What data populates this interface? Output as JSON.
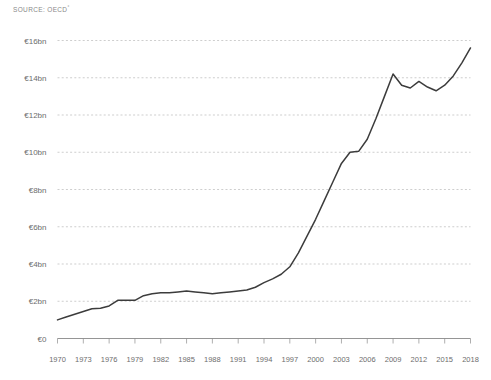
{
  "source": {
    "prefix": "SOURCE: OECD",
    "superscript": "°"
  },
  "chart_data": {
    "type": "line",
    "title": "",
    "subtitle": "",
    "xlabel": "",
    "ylabel": "",
    "grid": "horizontal-dashed",
    "legend": "none",
    "xlim": [
      1970,
      2018
    ],
    "ylim": [
      0,
      16
    ],
    "y_unit": "€bn",
    "y_ticks": [
      0,
      2,
      4,
      6,
      8,
      10,
      12,
      14,
      16
    ],
    "y_tick_labels": [
      "€0",
      "€2bn",
      "€4bn",
      "€6bn",
      "€8bn",
      "€10bn",
      "€12bn",
      "€14bn",
      "€16bn"
    ],
    "x_ticks": [
      1970,
      1973,
      1976,
      1979,
      1982,
      1985,
      1988,
      1991,
      1994,
      1997,
      2000,
      2003,
      2006,
      2009,
      2012,
      2015,
      2018
    ],
    "x_tick_labels": [
      "1970",
      "1973",
      "1976",
      "1979",
      "1982",
      "1985",
      "1988",
      "1991",
      "1994",
      "1997",
      "2000",
      "2003",
      "2006",
      "2009",
      "2012",
      "2015",
      "2018"
    ],
    "line_color": "#3c3c3c",
    "series": [
      {
        "name": "Value",
        "x": [
          1970,
          1971,
          1972,
          1973,
          1974,
          1975,
          1976,
          1977,
          1978,
          1979,
          1980,
          1981,
          1982,
          1983,
          1984,
          1985,
          1986,
          1987,
          1988,
          1989,
          1990,
          1991,
          1992,
          1993,
          1994,
          1995,
          1996,
          1997,
          1998,
          1999,
          2000,
          2001,
          2002,
          2003,
          2004,
          2005,
          2006,
          2007,
          2008,
          2009,
          2010,
          2011,
          2012,
          2013,
          2014,
          2015,
          2016,
          2017,
          2018
        ],
        "values": [
          1.0,
          1.15,
          1.3,
          1.45,
          1.6,
          1.62,
          1.75,
          2.05,
          2.05,
          2.05,
          2.3,
          2.4,
          2.45,
          2.45,
          2.5,
          2.55,
          2.5,
          2.45,
          2.4,
          2.45,
          2.5,
          2.55,
          2.6,
          2.75,
          3.0,
          3.2,
          3.45,
          3.85,
          4.6,
          5.5,
          6.4,
          7.4,
          8.4,
          9.4,
          10.0,
          10.05,
          10.7,
          11.8,
          13.0,
          14.2,
          13.6,
          13.45,
          13.8,
          13.5,
          13.3,
          13.6,
          14.1,
          14.8,
          15.6
        ]
      }
    ]
  }
}
